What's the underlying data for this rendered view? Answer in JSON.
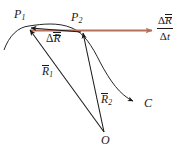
{
  "figure": {
    "name": "position-vector-displacement-diagram",
    "background_color": "#ffffff",
    "curve_color": "#1a1a1a",
    "vector_color": "#1a1a1a",
    "rate_vector_color": "#b5705c",
    "points": {
      "p1": {
        "label_delta": "",
        "label_main": "P",
        "label_sub": "1",
        "x": 28,
        "y": 29
      },
      "p2": {
        "label_main": "P",
        "label_sub": "2",
        "x": 82,
        "y": 31
      },
      "origin": {
        "label_main": "O",
        "label_sub": "",
        "x": 105,
        "y": 133
      },
      "curve_end": {
        "label_main": "C",
        "label_sub": "",
        "x": 140,
        "y": 104
      }
    },
    "vectors": [
      {
        "name": "displacement-vector",
        "label_delta": "Δ",
        "label_main": "R",
        "label_sub": "",
        "overbar": true,
        "from": "P1",
        "to": "P2",
        "color": "#1a1a1a"
      },
      {
        "name": "position-vector-1",
        "label_delta": "",
        "label_main": "R",
        "label_sub": "1",
        "overbar": true,
        "from": "O",
        "to": "P1",
        "color": "#1a1a1a"
      },
      {
        "name": "position-vector-2",
        "label_delta": "",
        "label_main": "R",
        "label_sub": "2",
        "overbar": true,
        "from": "O",
        "to": "P2",
        "color": "#1a1a1a"
      },
      {
        "name": "average-velocity-vector",
        "label_delta": "Δ",
        "label_main": "R",
        "label_sub": "",
        "overbar": true,
        "from": "P1",
        "to": "right-edge",
        "color": "#b5705c"
      }
    ],
    "rate_label": {
      "numerator_delta": "Δ",
      "numerator_main": "R",
      "denominator_delta": "Δ",
      "denominator_main": "t"
    },
    "curve": {
      "name": "trajectory-curve-C",
      "label": "C",
      "description": "smooth path through P1 and P2 ending at C"
    }
  }
}
